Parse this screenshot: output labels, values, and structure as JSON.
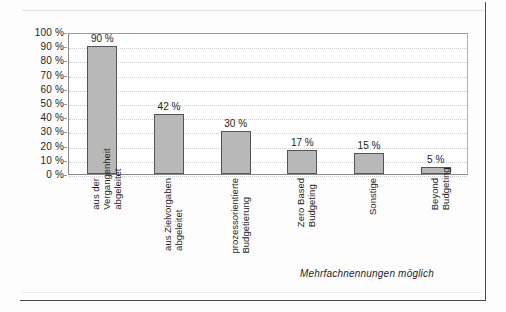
{
  "chart_data": {
    "type": "bar",
    "title": "",
    "subtitle": "",
    "xlabel": "",
    "ylabel": "",
    "ylim": [
      0,
      100
    ],
    "ytick_step": 10,
    "ytick_labels": [
      "0 %",
      "10 %",
      "20 %",
      "30 %",
      "40 %",
      "50 %",
      "60 %",
      "70 %",
      "80 %",
      "90 %",
      "100 %"
    ],
    "ytick_values": [
      0,
      10,
      20,
      30,
      40,
      50,
      60,
      70,
      80,
      90,
      100
    ],
    "grid": true,
    "grid_style": "dotted-horizontal",
    "legend": null,
    "legend_position": "none",
    "bar_fill_color": "#b8b8b8",
    "bar_border_color": "#545454",
    "categories": [
      "aus der Vergangenheit abgeleitet",
      "aus Zielvorgaben abgeleitet",
      "prozessorientierte Budgetierung",
      "Zero Based Budgeting",
      "Sonstige",
      "Beyond Budgeting"
    ],
    "category_lines": [
      [
        "aus der",
        "Vergangenheit",
        "abgeleitet"
      ],
      [
        "aus Zielvorgaben",
        "abgeleitet"
      ],
      [
        "prozessorientierte",
        "Budgetierung"
      ],
      [
        "Zero Based",
        "Budgeting"
      ],
      [
        "Sonstige"
      ],
      [
        "Beyond",
        "Budgeting"
      ]
    ],
    "values": [
      90,
      42,
      30,
      17,
      15,
      5
    ],
    "value_labels": [
      "90 %",
      "42 %",
      "30 %",
      "17 %",
      "15 %",
      "5 %"
    ],
    "annotation": "Mehrfachnennungen möglich"
  }
}
